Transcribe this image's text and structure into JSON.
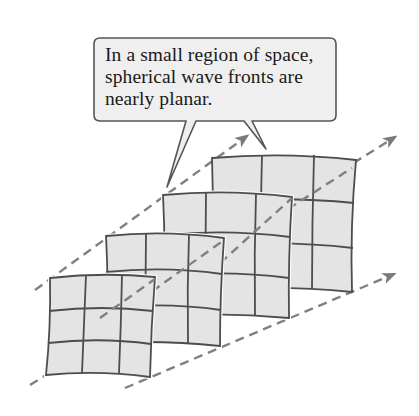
{
  "diagram": {
    "callout": {
      "lines": [
        "In a small region of space,",
        "spherical wave fronts are",
        "nearly planar."
      ]
    },
    "colors": {
      "panel_fill": "#e4e4e4",
      "grid_line": "#4d4d4d",
      "dash_line": "#808080",
      "callout_fill": "#efefef",
      "callout_border": "#555555"
    },
    "wavefronts": [
      {
        "name": "wavefront-1",
        "grid": "3x3"
      },
      {
        "name": "wavefront-2",
        "grid": "3x3"
      },
      {
        "name": "wavefront-3",
        "grid": "3x3"
      },
      {
        "name": "wavefront-4",
        "grid": "3x3"
      }
    ],
    "ray_arrows": 3
  }
}
